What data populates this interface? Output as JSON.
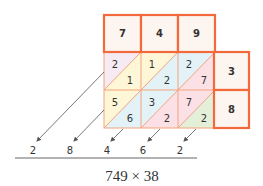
{
  "multiplicand_digits": [
    "7",
    "4",
    "9"
  ],
  "multiplier_digits": [
    "3",
    "8"
  ],
  "cells": [
    [
      {
        "tens": "2",
        "ones": "1"
      },
      {
        "tens": "1",
        "ones": "2"
      },
      {
        "tens": "2",
        "ones": "7"
      }
    ],
    [
      {
        "tens": "5",
        "ones": "6"
      },
      {
        "tens": "3",
        "ones": "2"
      },
      {
        "tens": "7",
        "ones": "2"
      }
    ]
  ],
  "result_digits": [
    "2",
    "8",
    "4",
    "6",
    "2"
  ],
  "caption": "749 × 38",
  "colors": {
    "border_accent": "#f26a3c",
    "grid_line": "#f4a27c",
    "box_fill": "#fdf5ef",
    "diag_lavender": "#f6eaf3",
    "diag_yellow": "#fdf7d8",
    "diag_blue": "#e2f2f7",
    "diag_pink": "#fbe1e6",
    "diag_green": "#e3efd9",
    "arrow": "#555555",
    "text": "#333333"
  }
}
